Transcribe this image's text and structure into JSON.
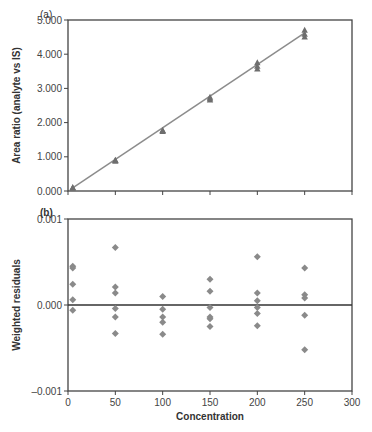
{
  "chart_data": [
    {
      "type": "scatter",
      "panel_label": "(a)",
      "title": "",
      "xlabel": "",
      "ylabel": "Area ratio (analyte vs IS)",
      "xlim": [
        0,
        300
      ],
      "ylim": [
        0,
        5
      ],
      "yticks": [
        "0.000",
        "1.000",
        "2.000",
        "3.000",
        "4.000",
        "5.000"
      ],
      "xticks": [
        0,
        50,
        100,
        150,
        200,
        250,
        300
      ],
      "xtick_labels_shown": false,
      "grid": false,
      "marker": "triangle",
      "series": [
        {
          "name": "calibration standards",
          "points": [
            [
              5,
              0.08
            ],
            [
              5,
              0.1
            ],
            [
              5,
              0.09
            ],
            [
              50,
              0.87
            ],
            [
              50,
              0.9
            ],
            [
              50,
              0.89
            ],
            [
              100,
              1.74
            ],
            [
              100,
              1.77
            ],
            [
              100,
              1.76
            ],
            [
              150,
              2.66
            ],
            [
              150,
              2.7
            ],
            [
              150,
              2.74
            ],
            [
              200,
              3.57
            ],
            [
              200,
              3.65
            ],
            [
              200,
              3.75
            ],
            [
              250,
              4.5
            ],
            [
              250,
              4.58
            ],
            [
              250,
              4.7
            ]
          ]
        }
      ],
      "fit_line": {
        "x": [
          5,
          250
        ],
        "y": [
          0.09,
          4.62
        ]
      }
    },
    {
      "type": "scatter",
      "panel_label": "(b)",
      "title": "",
      "xlabel": "Concentration",
      "ylabel": "Weighted residuals",
      "xlim": [
        0,
        300
      ],
      "ylim": [
        -0.001,
        0.001
      ],
      "yticks": [
        "-0.001",
        "0.000",
        "0.001"
      ],
      "xticks": [
        "0",
        "50",
        "100",
        "150",
        "200",
        "250",
        "300"
      ],
      "grid": false,
      "zero_line": true,
      "marker": "diamond",
      "series": [
        {
          "name": "weighted residuals",
          "points": [
            [
              5,
              0.00045
            ],
            [
              5,
              0.00043
            ],
            [
              5,
              0.00024
            ],
            [
              5,
              6e-05
            ],
            [
              5,
              -6e-05
            ],
            [
              50,
              0.00067
            ],
            [
              50,
              0.00021
            ],
            [
              50,
              0.00014
            ],
            [
              50,
              -4e-05
            ],
            [
              50,
              -0.00014
            ],
            [
              50,
              -0.00033
            ],
            [
              100,
              0.0001
            ],
            [
              100,
              -5e-05
            ],
            [
              100,
              -0.00014
            ],
            [
              100,
              -0.0002
            ],
            [
              100,
              -0.00034
            ],
            [
              150,
              0.0003
            ],
            [
              150,
              0.00016
            ],
            [
              150,
              -3e-05
            ],
            [
              150,
              -0.00014
            ],
            [
              150,
              -0.00016
            ],
            [
              150,
              -0.00025
            ],
            [
              200,
              0.00056
            ],
            [
              200,
              0.00014
            ],
            [
              200,
              5e-05
            ],
            [
              200,
              -3e-05
            ],
            [
              200,
              -0.0001
            ],
            [
              200,
              -0.00024
            ],
            [
              250,
              0.00043
            ],
            [
              250,
              0.00012
            ],
            [
              250,
              8e-05
            ],
            [
              250,
              -0.00012
            ],
            [
              250,
              -0.00052
            ]
          ]
        }
      ]
    }
  ],
  "colors": {
    "axis": "#444444",
    "marker": "#8a8a8a",
    "fit_line": "#8c8c8c",
    "text": "#333333"
  }
}
